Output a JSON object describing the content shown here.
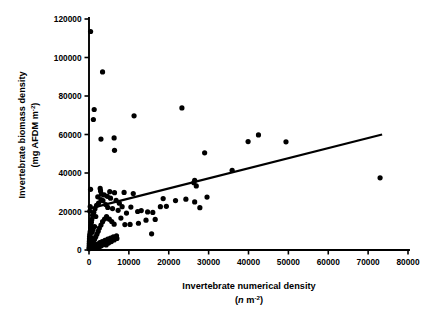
{
  "chart_data": {
    "type": "scatter",
    "title": "",
    "xlabel": "Invertebrate numerical density",
    "xlabel_units": "(n m-2)",
    "xlabel_units_prefix": "(",
    "xlabel_units_italic": "n",
    "xlabel_units_mid": " m",
    "xlabel_units_exp": "-2",
    "xlabel_units_suffix": ")",
    "ylabel": "Invertebrate biomass density",
    "ylabel_units": "(mg AFDM m-2)",
    "ylabel_units_main": "(mg AFDM m",
    "ylabel_units_exp": "-2",
    "ylabel_units_suffix": ")",
    "xlim": [
      0,
      80000
    ],
    "ylim": [
      0,
      120000
    ],
    "xticks": [
      0,
      10000,
      20000,
      30000,
      40000,
      50000,
      60000,
      70000,
      80000
    ],
    "xticklabels": [
      "0",
      "10000",
      "20000",
      "30000",
      "40000",
      "50000",
      "60000",
      "70000",
      "80000"
    ],
    "yticks": [
      0,
      20000,
      40000,
      60000,
      80000,
      100000,
      120000
    ],
    "yticklabels": [
      "0",
      "20000",
      "40000",
      "60000",
      "80000",
      "100000",
      "120000"
    ],
    "grid": false,
    "legend": null,
    "marker": "filled-circle",
    "marker_color": "#000000",
    "marker_size_px": 5.2,
    "trendline": {
      "type": "linear-fit",
      "color": "#000000",
      "x_start": 0,
      "y_start": 21500,
      "x_end": 73500,
      "y_end": 60000
    },
    "points": [
      [
        400,
        113500
      ],
      [
        3400,
        92500
      ],
      [
        1300,
        73000
      ],
      [
        23300,
        73800
      ],
      [
        11300,
        69700
      ],
      [
        1100,
        67800
      ],
      [
        3000,
        57600
      ],
      [
        6300,
        58200
      ],
      [
        42500,
        59800
      ],
      [
        39900,
        56300
      ],
      [
        49400,
        56200
      ],
      [
        6400,
        51800
      ],
      [
        29000,
        50500
      ],
      [
        35900,
        41400
      ],
      [
        73000,
        37500
      ],
      [
        26300,
        35000
      ],
      [
        26900,
        33300
      ],
      [
        26500,
        36200
      ],
      [
        2800,
        32000
      ],
      [
        2900,
        30700
      ],
      [
        3100,
        29000
      ],
      [
        5200,
        30300
      ],
      [
        6400,
        29800
      ],
      [
        8800,
        29900
      ],
      [
        11100,
        29300
      ],
      [
        400,
        31500
      ],
      [
        300,
        22600
      ],
      [
        200,
        20200
      ],
      [
        18600,
        26700
      ],
      [
        21700,
        25700
      ],
      [
        24300,
        26400
      ],
      [
        26500,
        25000
      ],
      [
        29600,
        27500
      ],
      [
        27800,
        22000
      ],
      [
        19400,
        22700
      ],
      [
        17900,
        22500
      ],
      [
        14700,
        19800
      ],
      [
        16000,
        19500
      ],
      [
        12200,
        20000
      ],
      [
        10500,
        22300
      ],
      [
        9400,
        19200
      ],
      [
        7300,
        20600
      ],
      [
        5900,
        21500
      ],
      [
        4700,
        22100
      ],
      [
        4200,
        23600
      ],
      [
        3500,
        25600
      ],
      [
        3000,
        26200
      ],
      [
        2400,
        24400
      ],
      [
        1900,
        23200
      ],
      [
        1500,
        21400
      ],
      [
        1200,
        19600
      ],
      [
        900,
        18000
      ],
      [
        700,
        15900
      ],
      [
        600,
        14400
      ],
      [
        500,
        12800
      ],
      [
        400,
        11400
      ],
      [
        300,
        9600
      ],
      [
        200,
        8200
      ],
      [
        150,
        7000
      ],
      [
        120,
        5800
      ],
      [
        100,
        4600
      ],
      [
        80,
        3500
      ],
      [
        60,
        2400
      ],
      [
        40,
        1300
      ],
      [
        30,
        600
      ],
      [
        500,
        1100
      ],
      [
        700,
        2100
      ],
      [
        900,
        3200
      ],
      [
        1100,
        4300
      ],
      [
        1400,
        5600
      ],
      [
        1700,
        6900
      ],
      [
        2000,
        8300
      ],
      [
        2300,
        9800
      ],
      [
        2600,
        11400
      ],
      [
        3000,
        13000
      ],
      [
        3400,
        14700
      ],
      [
        3900,
        16100
      ],
      [
        4400,
        17300
      ],
      [
        5100,
        16000
      ],
      [
        5700,
        14800
      ],
      [
        6300,
        13400
      ],
      [
        6900,
        7400
      ],
      [
        6100,
        6800
      ],
      [
        5400,
        6200
      ],
      [
        4700,
        5600
      ],
      [
        4000,
        5000
      ],
      [
        3300,
        4400
      ],
      [
        2700,
        3800
      ],
      [
        2100,
        3100
      ],
      [
        1600,
        2500
      ],
      [
        1200,
        1900
      ],
      [
        1000,
        900
      ],
      [
        1500,
        900
      ],
      [
        2100,
        1000
      ],
      [
        2600,
        1500
      ],
      [
        3100,
        2200
      ],
      [
        3700,
        3000
      ],
      [
        4300,
        2600
      ],
      [
        4900,
        3600
      ],
      [
        5600,
        4400
      ],
      [
        6300,
        5200
      ],
      [
        7000,
        6000
      ],
      [
        8000,
        16600
      ],
      [
        9000,
        13200
      ],
      [
        10300,
        13300
      ],
      [
        12400,
        13900
      ],
      [
        13100,
        20500
      ],
      [
        14300,
        15500
      ],
      [
        15700,
        8400
      ],
      [
        16600,
        15900
      ],
      [
        8300,
        22500
      ],
      [
        7600,
        24300
      ],
      [
        6800,
        25800
      ],
      [
        5400,
        26900
      ],
      [
        4600,
        27900
      ],
      [
        3800,
        28600
      ],
      [
        2200,
        27600
      ],
      [
        1700,
        17400
      ],
      [
        1400,
        12200
      ],
      [
        1000,
        10600
      ],
      [
        800,
        9200
      ],
      [
        600,
        6400
      ],
      [
        450,
        4100
      ],
      [
        250,
        1800
      ]
    ]
  }
}
